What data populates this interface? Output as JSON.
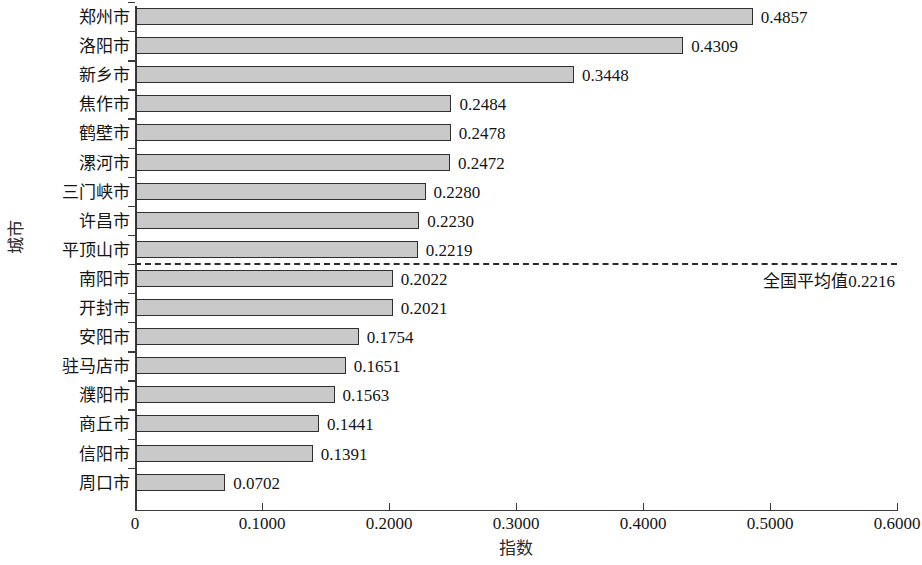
{
  "chart_data": {
    "type": "bar",
    "orientation": "horizontal",
    "title": "",
    "xlabel": "指数",
    "ylabel": "城市",
    "xlim": [
      0,
      0.6
    ],
    "grid": false,
    "legend": null,
    "xticks": [
      "0",
      "0.1000",
      "0.2000",
      "0.3000",
      "0.4000",
      "0.5000",
      "0.6000"
    ],
    "xtick_values": [
      0,
      0.1,
      0.2,
      0.3,
      0.4,
      0.5,
      0.6
    ],
    "categories": [
      "郑州市",
      "洛阳市",
      "新乡市",
      "焦作市",
      "鹤壁市",
      "漯河市",
      "三门峡市",
      "许昌市",
      "平顶山市",
      "南阳市",
      "开封市",
      "安阳市",
      "驻马店市",
      "濮阳市",
      "商丘市",
      "信阳市",
      "周口市"
    ],
    "values": [
      0.4857,
      0.4309,
      0.3448,
      0.2484,
      0.2478,
      0.2472,
      0.228,
      0.223,
      0.2219,
      0.2022,
      0.2021,
      0.1754,
      0.1651,
      0.1563,
      0.1441,
      0.1391,
      0.0702
    ],
    "value_labels": [
      "0.4857",
      "0.4309",
      "0.3448",
      "0.2484",
      "0.2478",
      "0.2472",
      "0.2280",
      "0.2230",
      "0.2219",
      "0.2022",
      "0.2021",
      "0.1754",
      "0.1651",
      "0.1563",
      "0.1441",
      "0.1391",
      "0.0702"
    ],
    "bar_color": "#c9c9c9",
    "bar_edge_color": "#2f2f2f",
    "reference_line": {
      "label": "全国平均值0.2216",
      "value": 0.2216,
      "style": "dashed",
      "color": "#2b2b2b",
      "position_after_category": "平顶山市"
    }
  }
}
